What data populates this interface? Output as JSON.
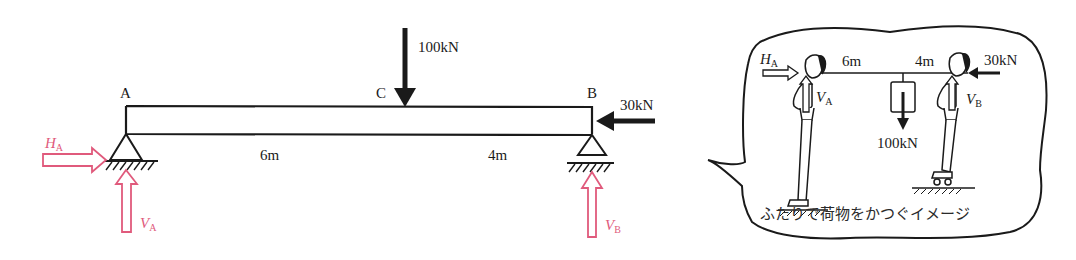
{
  "beam_diagram": {
    "points": {
      "a": "A",
      "b": "B",
      "c": "C"
    },
    "loads": {
      "vertical": "100kN",
      "horizontal": "30kN"
    },
    "spans": {
      "left": "6m",
      "right": "4m"
    },
    "reactions": {
      "ha_symbol": "H",
      "ha_sub": "A",
      "va_symbol": "V",
      "va_sub": "A",
      "vb_symbol": "V",
      "vb_sub": "B"
    },
    "colors": {
      "reaction": "#e05a7c",
      "beam": "#1a1a1a"
    }
  },
  "illustration": {
    "ha_symbol": "H",
    "ha_sub": "A",
    "va_symbol": "V",
    "va_sub": "A",
    "vb_symbol": "V",
    "vb_sub": "B",
    "span_left": "6m",
    "span_right": "4m",
    "load_vertical": "100kN",
    "load_horizontal": "30kN",
    "caption": "ふたりで荷物をかつぐイメージ"
  }
}
